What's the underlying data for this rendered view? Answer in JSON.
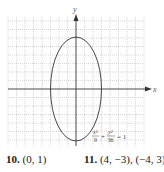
{
  "graph": {
    "x_axis_label": "x",
    "y_axis_label": "y",
    "equation": {
      "num1": "x²",
      "den1": "9",
      "plus": "+",
      "num2": "y²",
      "den2": "36",
      "eq": "= 1"
    },
    "ellipse": {
      "a_x": 3,
      "b_y": 6,
      "center": [
        0,
        0
      ]
    },
    "colors": {
      "grid": "#bdbdbd",
      "axis": "#333333",
      "curve": "#333333"
    }
  },
  "answers": [
    {
      "number": "10.",
      "value": "(0, 1)"
    },
    {
      "number": "11.",
      "value": "(4, −3), (−4, 3)"
    }
  ]
}
